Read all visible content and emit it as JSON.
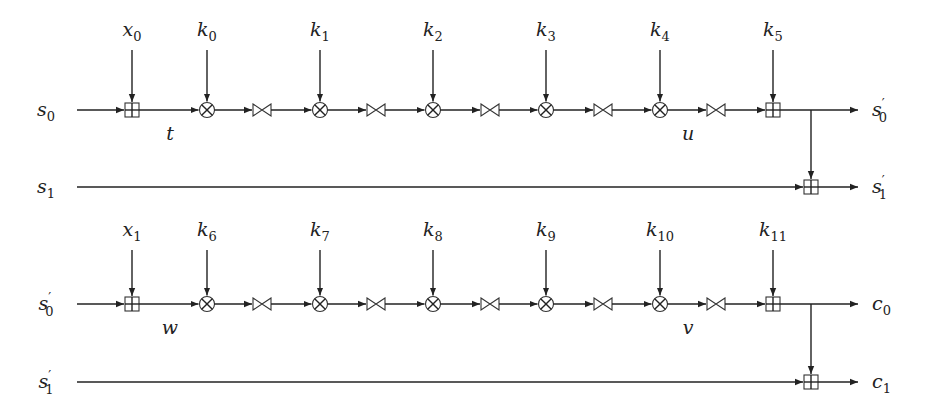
{
  "blocks": [
    {
      "name": "block-1",
      "y_main": 110,
      "y_second": 187,
      "y_label": 30,
      "input_main": {
        "base": "s",
        "sub": "0",
        "prime": false
      },
      "input_second": {
        "base": "s",
        "sub": "1",
        "prime": false
      },
      "output_main": {
        "base": "s",
        "sub": "0",
        "prime": true
      },
      "output_second": {
        "base": "s",
        "sub": "1",
        "prime": true
      },
      "entry_key": {
        "base": "x",
        "sub": "0"
      },
      "round_keys": [
        {
          "base": "k",
          "sub": "0"
        },
        {
          "base": "k",
          "sub": "1"
        },
        {
          "base": "k",
          "sub": "2"
        },
        {
          "base": "k",
          "sub": "3"
        },
        {
          "base": "k",
          "sub": "4"
        }
      ],
      "exit_key": {
        "base": "k",
        "sub": "5"
      },
      "wire_labels": [
        {
          "text": "t",
          "x": 170
        },
        {
          "text": "u",
          "x": 688
        }
      ]
    },
    {
      "name": "block-2",
      "y_main": 304,
      "y_second": 382,
      "y_label": 230,
      "input_main": {
        "base": "s",
        "sub": "0",
        "prime": true
      },
      "input_second": {
        "base": "s",
        "sub": "1",
        "prime": true
      },
      "output_main": {
        "base": "c",
        "sub": "0",
        "prime": false
      },
      "output_second": {
        "base": "c",
        "sub": "1",
        "prime": false
      },
      "entry_key": {
        "base": "x",
        "sub": "1"
      },
      "round_keys": [
        {
          "base": "k",
          "sub": "6"
        },
        {
          "base": "k",
          "sub": "7"
        },
        {
          "base": "k",
          "sub": "8"
        },
        {
          "base": "k",
          "sub": "9"
        },
        {
          "base": "k",
          "sub": "10"
        }
      ],
      "exit_key": {
        "base": "k",
        "sub": "11"
      },
      "wire_labels": [
        {
          "text": "w",
          "x": 170
        },
        {
          "text": "v",
          "x": 688
        }
      ]
    }
  ],
  "layout": {
    "entry_x": 132,
    "mult_x": [
      207,
      320,
      433,
      546,
      660
    ],
    "bowtie_x": [
      262,
      376,
      490,
      603,
      716
    ],
    "exit_x": 773,
    "branch_x": 811,
    "line_start_x": 77,
    "line_end_x": 858,
    "out_label_x": 872
  },
  "legend": {
    "boxplus": "modular addition",
    "otimes": "multiplication",
    "bowtie": "rotation/swap"
  }
}
